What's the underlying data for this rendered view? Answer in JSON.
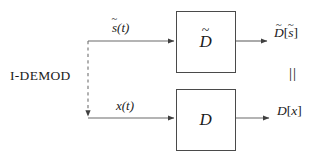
{
  "diagram": {
    "background_color": "#ffffff",
    "line_color": "#4a4a4a",
    "text_color": "#1b1b1b",
    "width": 332,
    "height": 158
  },
  "labels": {
    "demod": "I-DEMOD",
    "input_top_base": "s",
    "input_top_arg": "(t)",
    "input_bottom_base": "x",
    "input_bottom_arg": "(t)",
    "output_top_operator": "D",
    "output_top_bracket_open": "[",
    "output_top_arg": "s",
    "output_top_bracket_close": "]",
    "output_bottom_operator": "D",
    "output_bottom_bracket_open": "[",
    "output_bottom_arg": "x",
    "output_bottom_bracket_close": "]",
    "equality": "||",
    "tilde": "~"
  },
  "blocks": [
    {
      "name": "top-operator-block",
      "symbol": "D",
      "has_tilde": true,
      "x": 176,
      "y": 11,
      "width": 60,
      "height": 62
    },
    {
      "name": "bottom-operator-block",
      "symbol": "D",
      "has_tilde": false,
      "x": 176,
      "y": 89,
      "width": 60,
      "height": 62
    }
  ],
  "wires": [
    {
      "name": "top-input-wire",
      "style": "solid",
      "from_x": 88,
      "from_y": 41,
      "to_x": 176,
      "to_y": 41,
      "arrowhead": true
    },
    {
      "name": "top-output-wire",
      "style": "solid",
      "from_x": 236,
      "from_y": 41,
      "to_x": 268,
      "to_y": 41,
      "arrowhead": true
    },
    {
      "name": "bottom-input-wire",
      "style": "solid",
      "from_x": 88,
      "from_y": 118,
      "to_x": 176,
      "to_y": 118,
      "arrowhead": true
    },
    {
      "name": "bottom-output-wire",
      "style": "solid",
      "from_x": 236,
      "from_y": 118,
      "to_x": 270,
      "to_y": 118,
      "arrowhead": true
    },
    {
      "name": "demod-dashed-wire",
      "style": "dashed",
      "from_x": 88,
      "from_y": 41,
      "to_x": 88,
      "to_y": 118,
      "arrowhead": true
    }
  ]
}
